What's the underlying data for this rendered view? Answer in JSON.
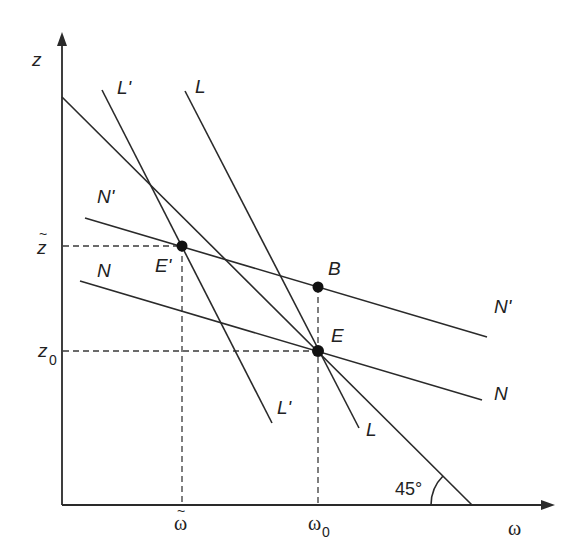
{
  "diagram": {
    "axes": {
      "y_label": "z",
      "x_label": "ω"
    },
    "curves": {
      "L_prime": {
        "label_top": "L'",
        "label_bottom": "L'"
      },
      "L": {
        "label_top": "L",
        "label_bottom": "L"
      },
      "N_prime": {
        "label_left": "N'",
        "label_right": "N'"
      },
      "N": {
        "label_left": "N",
        "label_right": "N"
      },
      "forty_five": {
        "angle_label": "45°"
      }
    },
    "points": {
      "E_prime": {
        "label": "E'"
      },
      "B": {
        "label": "B"
      },
      "E": {
        "label": "E"
      }
    },
    "ticks": {
      "z_tilde": {
        "main": "z",
        "accent": "~"
      },
      "z0": {
        "main": "z",
        "sub": "0"
      },
      "omega_tilde": {
        "main": "ω",
        "accent": "~"
      },
      "omega0": {
        "main": "ω",
        "sub": "0"
      }
    }
  }
}
